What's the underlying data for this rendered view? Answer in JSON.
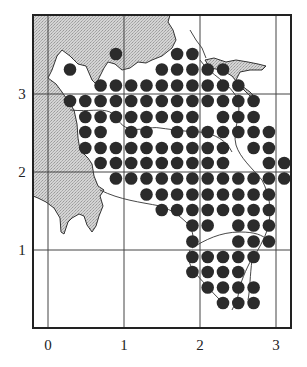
{
  "figure": {
    "type": "grid-map",
    "frame": {
      "x0": 33,
      "y0": 15,
      "x1": 291,
      "y1": 328
    },
    "x_axis": {
      "ticks": [
        {
          "label": "0",
          "px": 48
        },
        {
          "label": "1",
          "px": 124
        },
        {
          "label": "2",
          "px": 200
        },
        {
          "label": "3",
          "px": 276
        }
      ]
    },
    "y_axis": {
      "ticks": [
        {
          "label": "3",
          "py": 94
        },
        {
          "label": "2",
          "py": 172
        },
        {
          "label": "1",
          "py": 250
        }
      ]
    },
    "colors": {
      "land": "#c9c9c9",
      "dot": "#2b2b2b",
      "line": "#333333",
      "water": "#ffffff"
    },
    "dot_grid": {
      "col_x": [
        70,
        85.3,
        100.6,
        115.9,
        131.2,
        146.5,
        161.8,
        177.1,
        192.4,
        207.7,
        223,
        238.3,
        253.6,
        268.9,
        284.2
      ],
      "row_y": [
        54,
        69.5,
        85.5,
        101,
        117,
        132,
        148,
        163,
        178.5,
        194.5,
        210,
        225.5,
        241.5,
        257,
        272,
        287.5,
        303
      ],
      "radius": 6.3,
      "rows": [
        [
          3,
          7,
          8
        ],
        [
          0,
          6,
          7,
          8,
          9,
          10
        ],
        [
          2,
          3,
          4,
          5,
          6,
          7,
          8,
          9,
          10,
          11
        ],
        [
          0,
          1,
          2,
          3,
          4,
          5,
          6,
          7,
          8,
          9,
          10,
          11,
          12
        ],
        [
          1,
          2,
          3,
          4,
          5,
          6,
          7,
          8,
          10,
          11,
          12
        ],
        [
          1,
          2,
          4,
          5,
          7,
          8,
          9,
          10,
          11,
          12,
          13
        ],
        [
          1,
          2,
          3,
          4,
          5,
          6,
          7,
          8,
          9,
          10,
          12,
          13
        ],
        [
          2,
          3,
          4,
          5,
          6,
          7,
          8,
          9,
          10,
          13,
          14
        ],
        [
          3,
          4,
          5,
          6,
          7,
          8,
          9,
          10,
          11,
          12,
          13,
          14
        ],
        [
          5,
          6,
          7,
          8,
          9,
          10,
          11,
          12,
          13
        ],
        [
          6,
          7,
          8,
          9,
          10,
          11,
          12,
          13
        ],
        [
          8,
          9,
          11,
          12,
          13
        ],
        [
          8,
          11,
          12,
          13
        ],
        [
          8,
          9,
          10,
          11,
          12
        ],
        [
          8,
          9,
          10,
          11
        ],
        [
          9,
          10,
          11,
          12
        ],
        [
          10,
          11,
          12
        ]
      ]
    }
  }
}
